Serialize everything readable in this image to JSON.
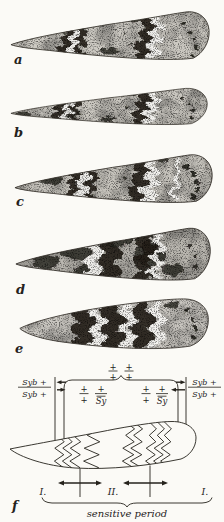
{
  "figure": {
    "panels": [
      "a",
      "b",
      "c",
      "d",
      "e",
      "f"
    ]
  },
  "diagram": {
    "top_left_fraction": {
      "num": "+",
      "den": "+"
    },
    "top_right_fraction": {
      "num": "+",
      "den": "+"
    },
    "outer_left_fraction": {
      "num": "Syb +",
      "den": "Syb +"
    },
    "outer_right_fraction": {
      "num": "Syb +",
      "den": "Syb +"
    },
    "inner_left_fractions": [
      {
        "num": "+",
        "den": "+"
      },
      {
        "num": "+",
        "den": "Sy"
      }
    ],
    "inner_right_fractions": [
      {
        "num": "+",
        "den": "+"
      },
      {
        "num": "+",
        "den": "Sy"
      }
    ],
    "region_labels": [
      "I.",
      "II.",
      "I."
    ],
    "caption": "sensitive period"
  },
  "colors": {
    "ink": "#25221c",
    "paper": "#fbfaf6",
    "wing_gray": "#c8c5bf"
  }
}
